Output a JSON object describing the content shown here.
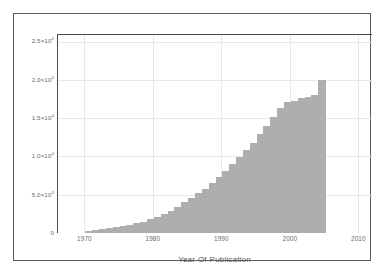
{
  "chart_data": {
    "type": "bar",
    "title": "",
    "subtitle": "",
    "xlabel": "Year-Of-Publication",
    "ylabel": "",
    "xlim": [
      1966,
      2012
    ],
    "ylim": [
      0,
      26000
    ],
    "grid": true,
    "legend": null,
    "bar_color": "#aeaeae",
    "axis_color": "#4a4a4a",
    "grid_color": "#e8e8e8",
    "tick_text_color": "#6b6b6b",
    "xticks": [
      {
        "value": 1970,
        "label": "1970"
      },
      {
        "value": 1980,
        "label": "1980"
      },
      {
        "value": 1990,
        "label": "1990"
      },
      {
        "value": 2000,
        "label": "2000"
      },
      {
        "value": 2010,
        "label": "2010"
      }
    ],
    "yticks": [
      {
        "value": 0,
        "mantissa": "0",
        "exponent": ""
      },
      {
        "value": 5000,
        "mantissa": "5.0",
        "exponent": "3"
      },
      {
        "value": 10000,
        "mantissa": "1.0",
        "exponent": "4"
      },
      {
        "value": 15000,
        "mantissa": "1.5",
        "exponent": "4"
      },
      {
        "value": 20000,
        "mantissa": "2.0",
        "exponent": "4"
      },
      {
        "value": 25000,
        "mantissa": "2.5",
        "exponent": "4"
      }
    ],
    "categories": [
      1970,
      1971,
      1972,
      1973,
      1974,
      1975,
      1976,
      1977,
      1978,
      1979,
      1980,
      1981,
      1982,
      1983,
      1984,
      1985,
      1986,
      1987,
      1988,
      1989,
      1990,
      1991,
      1992,
      1993,
      1994,
      1995,
      1996,
      1997,
      1998,
      1999,
      2000,
      2001,
      2002,
      2003,
      2004
    ],
    "values": [
      300,
      420,
      520,
      640,
      780,
      900,
      1050,
      1250,
      1500,
      1800,
      2100,
      2500,
      2900,
      3400,
      4000,
      4600,
      5200,
      5800,
      6500,
      7300,
      8100,
      9000,
      9900,
      10800,
      11800,
      12900,
      14000,
      15100,
      16300,
      17100,
      17200,
      17600,
      17800,
      18000,
      20000
    ]
  }
}
